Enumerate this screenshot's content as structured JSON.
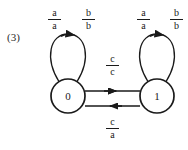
{
  "figure": {
    "index_label": "(3)",
    "type": "finite-state transducer diagram",
    "background_color": "#ffffff",
    "stroke_color": "#1a1a1a"
  },
  "states": [
    {
      "id": "state-0",
      "label": "0",
      "cx": 68,
      "cy": 96,
      "r": 17
    },
    {
      "id": "state-1",
      "label": "1",
      "cx": 157,
      "cy": 96,
      "r": 17
    }
  ],
  "labels": {
    "loop_left_a": {
      "numerator": "a",
      "denominator": "a"
    },
    "loop_left_b": {
      "numerator": "b",
      "denominator": "b"
    },
    "loop_right_a": {
      "numerator": "a",
      "denominator": "a"
    },
    "loop_right_b": {
      "numerator": "b",
      "denominator": "b"
    },
    "transition_forward": {
      "numerator": "c",
      "denominator": "c"
    },
    "transition_back": {
      "numerator": "c",
      "denominator": "a"
    }
  },
  "transitions": [
    {
      "id": "self-loop-0",
      "from": "0",
      "to": "0",
      "labels": [
        "a/a",
        "b/b"
      ]
    },
    {
      "id": "self-loop-1",
      "from": "1",
      "to": "1",
      "labels": [
        "a/a",
        "b/b"
      ]
    },
    {
      "id": "edge-0-to-1",
      "from": "0",
      "to": "1",
      "label": "c/c",
      "direction": "right"
    },
    {
      "id": "edge-1-to-0",
      "from": "1",
      "to": "0",
      "label": "c/a",
      "direction": "left"
    }
  ]
}
